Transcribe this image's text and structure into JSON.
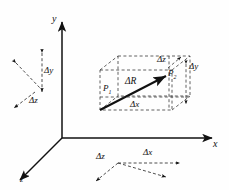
{
  "figure": {
    "background_color": "#fefefe",
    "stroke_color": "#111111",
    "width": 229,
    "height": 190
  },
  "axes": {
    "x_label": "x",
    "y_label": "y",
    "z_label": "z",
    "origin": {
      "x": 62,
      "y": 138
    }
  },
  "points": {
    "p1_label": "P",
    "p1_sub": "1",
    "p2_label": "P",
    "p2_sub": "2"
  },
  "vector": {
    "label_delta": "Δ",
    "label_R": "R",
    "full_label": "ΔR"
  },
  "components": {
    "dx": "Δx",
    "dy": "Δy",
    "dz": "Δz"
  },
  "box_labels": {
    "top_dz": "Δz",
    "right_dy": "Δy",
    "bottom_dx": "Δx"
  },
  "left_cluster": {
    "dy": "Δy",
    "dz": "Δz"
  },
  "bottom_cluster": {
    "dz": "Δz",
    "dx": "Δx"
  }
}
